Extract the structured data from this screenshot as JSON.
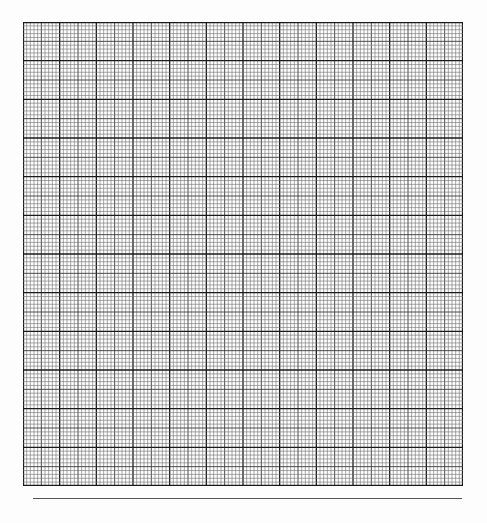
{
  "page": {
    "type": "graph-paper"
  },
  "grid": {
    "major_columns": 12,
    "major_rows": 12,
    "minor_per_major": 10,
    "medium_every": 5,
    "colors": {
      "minor": "#6e6e6e",
      "medium": "#3a3a3a",
      "major": "#1a1a1a",
      "rule": "#555555"
    }
  }
}
